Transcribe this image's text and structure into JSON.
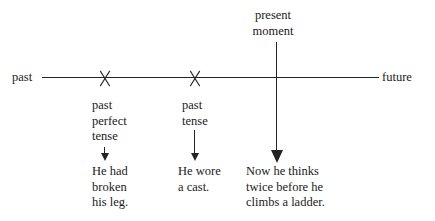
{
  "diagram": {
    "axis": {
      "left_label": "past",
      "right_label": "future",
      "line_color": "#242424"
    },
    "present_marker": {
      "label": "present\nmoment",
      "arrow": "down-arrow"
    },
    "events": [
      {
        "marker": "x-marker",
        "tense": "past\nperfect\ntense",
        "connector": "down-arrow",
        "example": "He had\nbroken\nhis leg."
      },
      {
        "marker": "x-marker",
        "tense": "past\ntense",
        "connector": "down-arrow",
        "example": "He wore\na cast."
      },
      {
        "marker": "vertical-line",
        "tense": "present\nmoment",
        "connector": "down-arrow",
        "example": "Now he thinks\ntwice before he\nclimbs a ladder."
      }
    ]
  }
}
